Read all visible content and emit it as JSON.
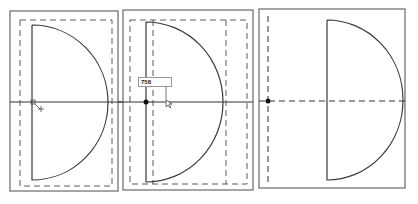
{
  "panels": [
    {
      "id": 1,
      "description": "semicircle with dashed margin, cursor at origin"
    },
    {
      "id": 2,
      "description": "semicircle with dimension input",
      "dimension_label": "758"
    },
    {
      "id": 3,
      "description": "semicircle positioned relative to dashed origin axes"
    }
  ],
  "colors": {
    "stroke": "#3a3a3a",
    "frame": "#6a6a6a",
    "background": "#ffffff"
  }
}
